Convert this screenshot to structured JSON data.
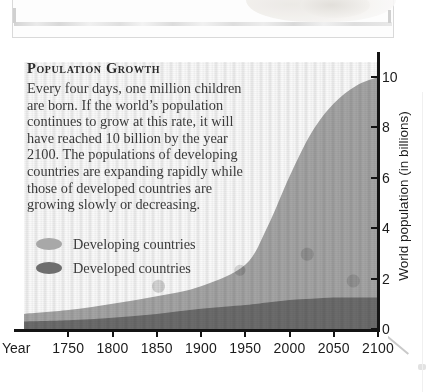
{
  "chart_data": {
    "type": "area",
    "title": "Population Growth",
    "xlabel": "Year",
    "ylabel": "World population (in billions)",
    "xlim": [
      1700,
      2100
    ],
    "ylim": [
      0,
      10.6
    ],
    "xticks": [
      1750,
      1800,
      1850,
      1900,
      1950,
      2000,
      2050,
      2100
    ],
    "xtick_labels": [
      "1750",
      "1800",
      "1850",
      "1900",
      "1950",
      "2000",
      "2050",
      "2100"
    ],
    "yticks": [
      0,
      2,
      4,
      6,
      8,
      10
    ],
    "ytick_labels": [
      "0",
      "2",
      "4",
      "6",
      "8",
      "10"
    ],
    "grid": false,
    "legend_position": "upper-left-inside",
    "stacked": true,
    "x": [
      1700,
      1750,
      1800,
      1850,
      1900,
      1950,
      1975,
      2000,
      2025,
      2050,
      2075,
      2100
    ],
    "series": [
      {
        "name": "Developed countries",
        "color": "#6e6e6e",
        "values": [
          0.3,
          0.35,
          0.45,
          0.6,
          0.8,
          0.95,
          1.05,
          1.15,
          1.2,
          1.25,
          1.25,
          1.25
        ]
      },
      {
        "name": "Developing countries",
        "color": "#a8a8a8",
        "values": [
          0.3,
          0.4,
          0.55,
          0.7,
          0.9,
          1.6,
          3.0,
          4.9,
          6.6,
          7.7,
          8.4,
          8.75
        ]
      }
    ],
    "totals": [
      0.6,
      0.75,
      1.0,
      1.3,
      1.7,
      2.55,
      4.05,
      6.05,
      7.8,
      8.95,
      9.65,
      10.0
    ],
    "annotations": []
  },
  "text_block": {
    "title": "Population Growth",
    "body": "Every four days, one million children are born. If the world’s population continues to grow at this rate, it will have reached 10 billion by the year 2100. The populations of developing countries are expanding rapidly while those of developed countries are growing slowly or decreasing."
  },
  "legend": {
    "items": [
      {
        "label": "Developing countries",
        "color": "#a8a8a8",
        "swatch": "ellipse-swatch-developing"
      },
      {
        "label": "Developed countries",
        "color": "#6e6e6e",
        "swatch": "ellipse-swatch-developed"
      }
    ]
  },
  "axes": {
    "x_caption": "Year",
    "y_title": "World population (in billions)"
  },
  "colors": {
    "developing": "#a8a8a8",
    "developed": "#6e6e6e",
    "axis": "#141414",
    "text": "#3a3a3a",
    "title_text": "#2a2a2a",
    "page_background": "#ffffff"
  }
}
